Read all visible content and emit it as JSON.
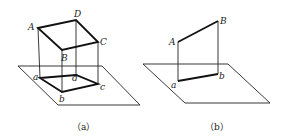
{
  "figure_a": {
    "caption": "（a）",
    "labels": {
      "A": "A",
      "B": "B",
      "C": "C",
      "D": "D",
      "a": "a",
      "b": "b",
      "c": "c",
      "d": "d"
    }
  },
  "figure_b": {
    "caption": "（b）",
    "labels": {
      "A": "A",
      "B": "B",
      "a": "a",
      "b": "b"
    }
  }
}
